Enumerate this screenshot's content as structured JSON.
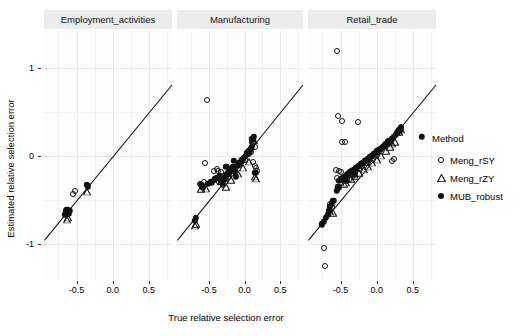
{
  "axes": {
    "x_title": "True relative selection error",
    "y_title": "Estimated relative selection error",
    "x_ticks": [
      "-0.5",
      "0.0",
      "0.5"
    ],
    "x_tick_values": [
      -0.5,
      0.0,
      0.5
    ],
    "y_ticks": [
      "1",
      "0",
      "-1"
    ],
    "y_tick_values": [
      1,
      0,
      -1
    ],
    "xlim": [
      -0.95,
      0.82
    ],
    "ylim": [
      -1.42,
      1.42
    ]
  },
  "legend": {
    "title": "Method",
    "items": [
      {
        "label": "Meng_rSY",
        "shape": "circle-open"
      },
      {
        "label": "Meng_rZY",
        "shape": "tri-open"
      },
      {
        "label": "MUB_robust",
        "shape": "circle-fill"
      }
    ]
  },
  "colors": {
    "point": "#111111",
    "refline": "#111111",
    "strip_bg": "#ececec",
    "panel_bg": "#fdfdfd",
    "grid": "#f1f1f1"
  },
  "chart_data": {
    "type": "scatter",
    "title": "",
    "xlabel": "True relative selection error",
    "ylabel": "Estimated relative selection error",
    "xlim": [
      -0.95,
      0.82
    ],
    "ylim": [
      -1.42,
      1.42
    ],
    "grid": true,
    "legend_position": "right",
    "reference_line": {
      "type": "identity",
      "slope": 1,
      "intercept": 0
    },
    "facets": [
      {
        "name": "Employment_activities",
        "series": [
          {
            "name": "Meng_rSY",
            "shape": "circle-open",
            "points": [
              [
                -0.555,
                -0.435
              ],
              [
                -0.515,
                -0.4
              ],
              [
                -0.64,
                -0.615
              ],
              [
                -0.625,
                -0.64
              ],
              [
                -0.355,
                -0.33
              ]
            ]
          },
          {
            "name": "Meng_rZY",
            "shape": "tri-open",
            "points": [
              [
                -0.635,
                -0.65
              ],
              [
                -0.62,
                -0.625
              ],
              [
                -0.35,
                -0.335
              ]
            ]
          },
          {
            "name": "MUB_robust",
            "shape": "circle-fill",
            "points": [
              [
                -0.645,
                -0.64
              ],
              [
                -0.63,
                -0.61
              ],
              [
                -0.615,
                -0.655
              ],
              [
                -0.6,
                -0.625
              ],
              [
                -0.655,
                -0.665
              ],
              [
                -0.36,
                -0.33
              ],
              [
                -0.345,
                -0.345
              ]
            ]
          }
        ]
      },
      {
        "name": "Manufacturing",
        "series": [
          {
            "name": "Meng_rSY",
            "shape": "circle-open",
            "points": [
              [
                -0.53,
                0.64
              ],
              [
                -0.56,
                -0.075
              ],
              [
                -0.43,
                -0.175
              ],
              [
                -0.395,
                -0.15
              ],
              [
                -0.37,
                -0.17
              ],
              [
                -0.33,
                -0.185
              ],
              [
                -0.3,
                -0.265
              ],
              [
                -0.27,
                -0.3
              ],
              [
                -0.255,
                -0.265
              ],
              [
                -0.225,
                -0.235
              ],
              [
                -0.19,
                -0.205
              ],
              [
                -0.155,
                -0.17
              ],
              [
                -0.12,
                -0.12
              ],
              [
                -0.085,
                -0.1
              ],
              [
                -0.05,
                -0.075
              ],
              [
                0.01,
                -0.05
              ],
              [
                0.06,
                0.02
              ],
              [
                0.09,
                0.045
              ],
              [
                0.12,
                -0.07
              ],
              [
                0.14,
                -0.115
              ],
              [
                0.155,
                -0.14
              ],
              [
                0.175,
                -0.175
              ],
              [
                0.12,
                0.15
              ],
              [
                0.15,
                0.105
              ],
              [
                -0.62,
                -0.32
              ],
              [
                -0.575,
                -0.295
              ],
              [
                -0.355,
                -0.295
              ],
              [
                -0.3,
                -0.33
              ]
            ]
          },
          {
            "name": "Meng_rZY",
            "shape": "tri-open",
            "points": [
              [
                -0.61,
                -0.305
              ],
              [
                -0.545,
                -0.295
              ],
              [
                -0.33,
                -0.215
              ],
              [
                -0.265,
                -0.28
              ],
              [
                -0.185,
                -0.2
              ],
              [
                -0.1,
                -0.125
              ],
              [
                -0.025,
                -0.06
              ],
              [
                0.055,
                0.01
              ],
              [
                0.115,
                0.255
              ],
              [
                0.13,
                0.245
              ],
              [
                0.15,
                -0.16
              ],
              [
                0.165,
                -0.185
              ],
              [
                -0.7,
                -0.72
              ],
              [
                -0.69,
                -0.7
              ]
            ]
          },
          {
            "name": "MUB_robust",
            "shape": "circle-fill",
            "points": [
              [
                -0.7,
                -0.735
              ],
              [
                -0.685,
                -0.705
              ],
              [
                -0.61,
                -0.33
              ],
              [
                -0.59,
                -0.355
              ],
              [
                -0.515,
                -0.315
              ],
              [
                -0.47,
                -0.3
              ],
              [
                -0.42,
                -0.265
              ],
              [
                -0.385,
                -0.245
              ],
              [
                -0.35,
                -0.225
              ],
              [
                -0.33,
                -0.275
              ],
              [
                -0.305,
                -0.31
              ],
              [
                -0.28,
                -0.255
              ],
              [
                -0.255,
                -0.215
              ],
              [
                -0.23,
                -0.195
              ],
              [
                -0.21,
                -0.175
              ],
              [
                -0.185,
                -0.155
              ],
              [
                -0.16,
                -0.13
              ],
              [
                -0.14,
                -0.17
              ],
              [
                -0.125,
                -0.23
              ],
              [
                -0.1,
                -0.11
              ],
              [
                -0.08,
                -0.085
              ],
              [
                -0.055,
                -0.065
              ],
              [
                -0.035,
                -0.04
              ],
              [
                -0.01,
                -0.02
              ],
              [
                0.015,
                0.005
              ],
              [
                0.04,
                0.03
              ],
              [
                0.065,
                0.055
              ],
              [
                0.09,
                0.085
              ],
              [
                0.11,
                0.19
              ],
              [
                0.13,
                0.215
              ],
              [
                0.15,
                -0.19
              ],
              [
                0.105,
                0.105
              ],
              [
                -0.15,
                -0.055
              ],
              [
                -0.255,
                -0.12
              ]
            ]
          }
        ]
      },
      {
        "name": "Retail_trade",
        "series": [
          {
            "name": "Meng_rSY",
            "shape": "circle-open",
            "points": [
              [
                -0.545,
                1.195
              ],
              [
                -0.53,
                0.455
              ],
              [
                -0.475,
                0.4
              ],
              [
                -0.255,
                0.39
              ],
              [
                -0.48,
                0.155
              ],
              [
                -0.44,
                0.155
              ],
              [
                -0.56,
                -0.155
              ],
              [
                -0.52,
                -0.17
              ],
              [
                -0.495,
                -0.18
              ],
              [
                -0.545,
                -0.255
              ],
              [
                -0.43,
                -0.23
              ],
              [
                -0.4,
                -0.215
              ],
              [
                -0.37,
                -0.26
              ],
              [
                -0.33,
                -0.225
              ],
              [
                -0.3,
                -0.19
              ],
              [
                -0.25,
                -0.15
              ],
              [
                -0.2,
                -0.115
              ],
              [
                -0.15,
                -0.075
              ],
              [
                -0.1,
                -0.04
              ],
              [
                -0.045,
                0.0
              ],
              [
                0.01,
                0.04
              ],
              [
                0.06,
                0.08
              ],
              [
                0.11,
                0.125
              ],
              [
                0.16,
                0.165
              ],
              [
                0.215,
                -0.06
              ],
              [
                0.235,
                -0.03
              ],
              [
                0.3,
                0.285
              ],
              [
                0.34,
                0.33
              ],
              [
                -0.725,
                -1.045
              ],
              [
                -0.715,
                -1.255
              ],
              [
                -0.65,
                -0.545
              ],
              [
                -0.62,
                -0.58
              ]
            ]
          },
          {
            "name": "Meng_rZY",
            "shape": "tri-open",
            "points": [
              [
                -0.64,
                -0.56
              ],
              [
                -0.605,
                -0.575
              ],
              [
                -0.455,
                -0.245
              ],
              [
                -0.42,
                -0.23
              ],
              [
                -0.355,
                -0.19
              ],
              [
                -0.3,
                -0.155
              ],
              [
                -0.24,
                -0.12
              ],
              [
                -0.18,
                -0.085
              ],
              [
                -0.12,
                -0.045
              ],
              [
                -0.06,
                -0.005
              ],
              [
                0.0,
                0.035
              ],
              [
                0.065,
                0.08
              ],
              [
                0.125,
                0.13
              ],
              [
                0.19,
                0.175
              ],
              [
                0.25,
                0.23
              ],
              [
                0.305,
                0.345
              ],
              [
                0.33,
                0.375
              ],
              [
                0.215,
                0.215
              ]
            ]
          },
          {
            "name": "MUB_robust",
            "shape": "circle-fill",
            "points": [
              [
                -0.76,
                -0.775
              ],
              [
                -0.735,
                -0.745
              ],
              [
                -0.705,
                -0.7
              ],
              [
                -0.68,
                -0.665
              ],
              [
                -0.66,
                -0.62
              ],
              [
                -0.645,
                -0.575
              ],
              [
                -0.625,
                -0.545
              ],
              [
                -0.6,
                -0.51
              ],
              [
                -0.52,
                -0.28
              ],
              [
                -0.49,
                -0.265
              ],
              [
                -0.465,
                -0.25
              ],
              [
                -0.44,
                -0.235
              ],
              [
                -0.415,
                -0.22
              ],
              [
                -0.39,
                -0.2
              ],
              [
                -0.365,
                -0.185
              ],
              [
                -0.34,
                -0.17
              ],
              [
                -0.315,
                -0.155
              ],
              [
                -0.29,
                -0.14
              ],
              [
                -0.265,
                -0.125
              ],
              [
                -0.24,
                -0.11
              ],
              [
                -0.215,
                -0.09
              ],
              [
                -0.19,
                -0.075
              ],
              [
                -0.165,
                -0.06
              ],
              [
                -0.14,
                -0.045
              ],
              [
                -0.115,
                -0.03
              ],
              [
                -0.09,
                -0.01
              ],
              [
                -0.065,
                0.005
              ],
              [
                -0.04,
                0.02
              ],
              [
                -0.015,
                0.035
              ],
              [
                0.01,
                0.055
              ],
              [
                0.035,
                0.07
              ],
              [
                0.06,
                0.085
              ],
              [
                0.085,
                0.105
              ],
              [
                0.11,
                0.12
              ],
              [
                0.135,
                0.14
              ],
              [
                0.16,
                0.155
              ],
              [
                0.185,
                0.175
              ],
              [
                0.21,
                0.195
              ],
              [
                0.235,
                0.215
              ],
              [
                0.26,
                0.24
              ],
              [
                0.285,
                0.265
              ],
              [
                0.31,
                0.29
              ],
              [
                0.335,
                0.315
              ],
              [
                0.62,
                0.215
              ],
              [
                -0.555,
                -0.395
              ],
              [
                -0.53,
                -0.355
              ],
              [
                -0.42,
                -0.285
              ],
              [
                -0.3,
                -0.215
              ]
            ]
          }
        ]
      }
    ]
  }
}
